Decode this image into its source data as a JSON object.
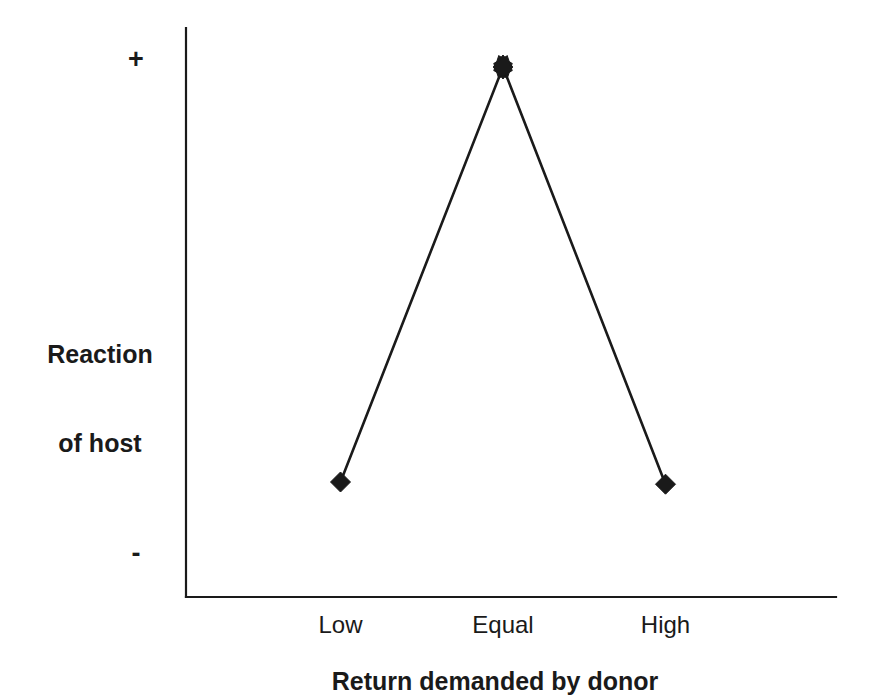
{
  "chart_data": {
    "type": "line",
    "title": "",
    "xlabel": "Return demanded by donor",
    "ylabel": "Reaction of host",
    "ylabel_line1": "Reaction",
    "ylabel_line2": "of host",
    "categories": [
      "Low",
      "Equal",
      "High"
    ],
    "values": [
      -0.82,
      1.0,
      -0.83
    ],
    "y_tick_labels": [
      "+",
      "-"
    ],
    "ylim": [
      -1.0,
      1.0
    ],
    "grid": false,
    "legend": null,
    "line_color": "#1a1a1a",
    "marker_color": "#1a1a1a",
    "axis_color": "#1a1a1a",
    "background_color": "#ffffff",
    "markers": [
      "diamond",
      "star",
      "diamond"
    ],
    "series": [
      {
        "name": "Reaction of host",
        "values": [
          -0.82,
          1.0,
          -0.83
        ]
      }
    ],
    "annotations": []
  },
  "figure": {
    "width": 878,
    "height": 700
  },
  "axes": {
    "y_positive_symbol": "+",
    "y_negative_symbol": "-",
    "y_title_line1": "Reaction",
    "y_title_line2": "of host",
    "x_title": "Return demanded by donor"
  },
  "ticks": {
    "x": [
      {
        "label": "Low"
      },
      {
        "label": "Equal"
      },
      {
        "label": "High"
      }
    ]
  }
}
